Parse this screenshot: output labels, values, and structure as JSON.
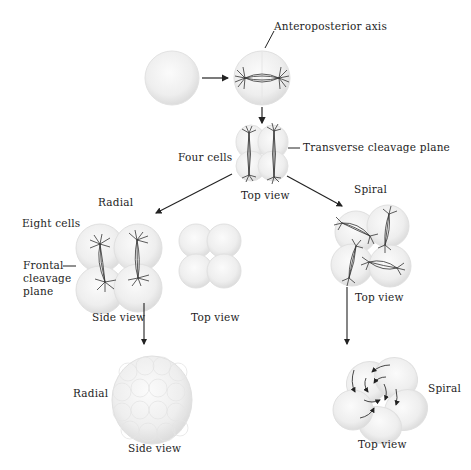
{
  "caption_fragment": "Spiral cleavage",
  "labels": {
    "anteroposterior_axis": "Anteroposterior axis",
    "four_cells": "Four cells",
    "transverse_cleavage_plane": "Transverse cleavage plane",
    "top_view_4cell": "Top view",
    "radial_heading": "Radial",
    "spiral_heading": "Spiral",
    "eight_cells": "Eight cells",
    "frontal_cleavage_plane": "Frontal\ncleavage\nplane",
    "frontal_line1": "Frontal",
    "frontal_line2": "cleavage",
    "frontal_line3": "plane",
    "side_view_radial_8": "Side view",
    "top_view_radial_8": "Top view",
    "top_view_spiral_8": "Top view",
    "radial_bottom": "Radial",
    "side_view_radial_bottom": "Side view",
    "spiral_bottom": "Spiral",
    "top_view_spiral_bottom": "Top view"
  },
  "stages": [
    {
      "id": "zygote",
      "description": "fertilized egg"
    },
    {
      "id": "two-cell",
      "description": "first division with spindle along anteroposterior axis"
    },
    {
      "id": "four-cell",
      "description": "four cells, top view"
    },
    {
      "id": "radial-eight-side",
      "description": "eight cells, radial, side view"
    },
    {
      "id": "radial-eight-top",
      "description": "eight cells, radial, top view"
    },
    {
      "id": "spiral-eight-top",
      "description": "eight cells, spiral, top view"
    },
    {
      "id": "radial-morula",
      "description": "radial, side view"
    },
    {
      "id": "spiral-morula",
      "description": "spiral, top view"
    }
  ]
}
